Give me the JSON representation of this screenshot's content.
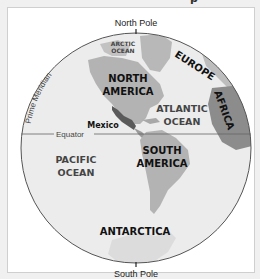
{
  "map": {
    "title_fragment": "p",
    "labels": {
      "north_pole": "North Pole",
      "south_pole": "South Pole",
      "prime_meridian": "Prime Meridian",
      "equator": "Equator"
    },
    "continents": {
      "north_america": [
        "NORTH",
        "AMERICA"
      ],
      "south_america": [
        "SOUTH",
        "AMERICA"
      ],
      "europe": "EUROPE",
      "africa": "AFRICA",
      "antarctica": "ANTARCTICA"
    },
    "oceans": {
      "arctic": [
        "ARCTIC",
        "OCEAN"
      ],
      "atlantic": [
        "ATLANTIC",
        "OCEAN"
      ],
      "pacific": [
        "PACIFIC",
        "OCEAN"
      ]
    },
    "highlighted_country": "Mexico",
    "colors": {
      "ocean": "#e9e9e9",
      "land": "#b3b3b3",
      "land_dark": "#8c8c8c",
      "highlight": "#555555",
      "outline": "#555555"
    }
  }
}
